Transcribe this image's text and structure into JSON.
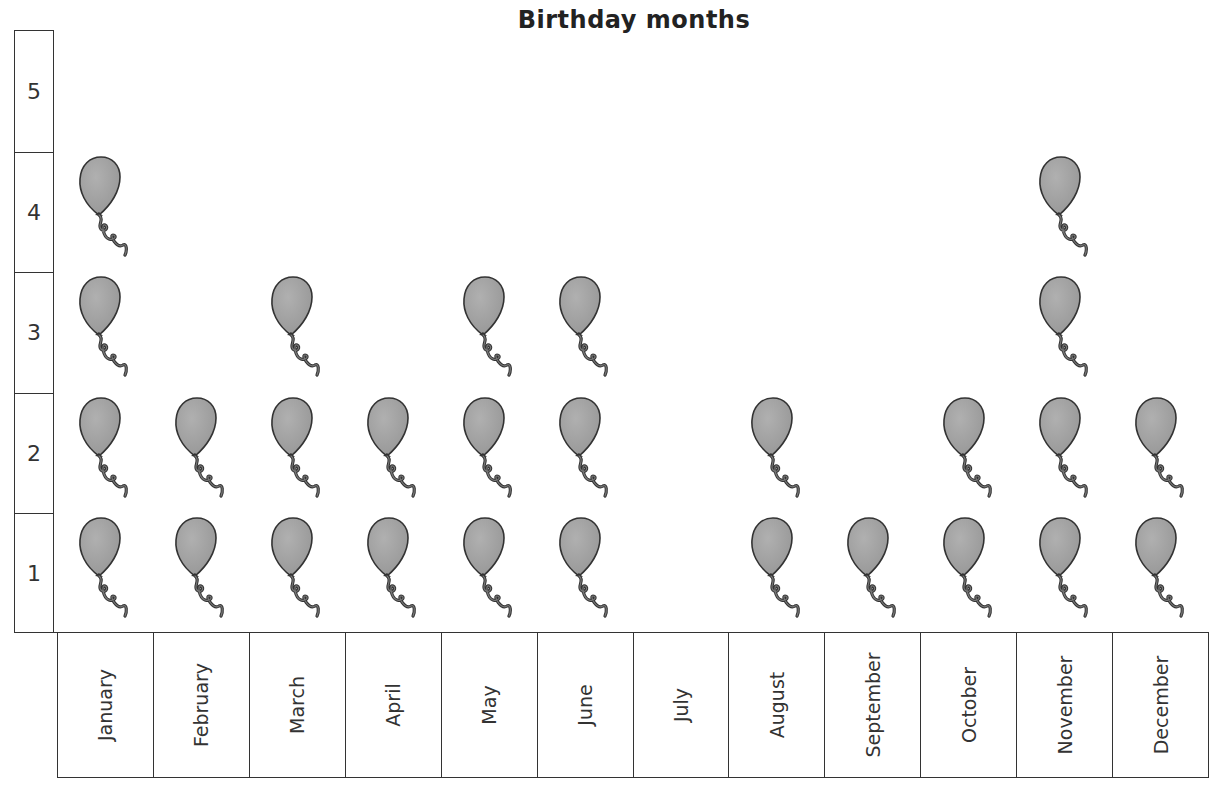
{
  "title": "Birthday months",
  "y_ticks": [
    "1",
    "2",
    "3",
    "4",
    "5"
  ],
  "months": [
    "January",
    "February",
    "March",
    "April",
    "May",
    "June",
    "July",
    "August",
    "September",
    "October",
    "November",
    "December"
  ],
  "icon": "balloon-icon",
  "colors": {
    "balloon_fill": "#999999",
    "outline": "#333333"
  },
  "chart_data": {
    "type": "bar",
    "subtype": "pictogram",
    "title": "Birthday months",
    "xlabel": "",
    "ylabel": "",
    "categories": [
      "January",
      "February",
      "March",
      "April",
      "May",
      "June",
      "July",
      "August",
      "September",
      "October",
      "November",
      "December"
    ],
    "values": [
      4,
      2,
      3,
      2,
      3,
      3,
      0,
      2,
      1,
      2,
      4,
      2
    ],
    "ylim": [
      0,
      5
    ],
    "y_ticks": [
      1,
      2,
      3,
      4,
      5
    ],
    "grid": false,
    "legend": "none",
    "unit_icon": "balloon"
  }
}
